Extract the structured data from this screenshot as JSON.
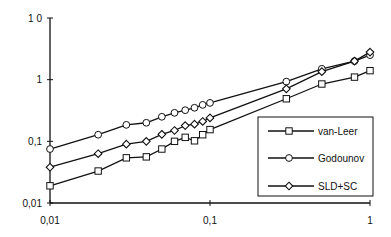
{
  "chart_data": {
    "type": "line",
    "title": "",
    "xlabel": "",
    "ylabel": "",
    "xscale": "log",
    "yscale": "log",
    "xlim": [
      0.01,
      1
    ],
    "ylim": [
      0.01,
      10
    ],
    "grid": false,
    "legend_position": "lower right (inside)",
    "x_ticks": [
      {
        "value": 0.01,
        "label": "0,01"
      },
      {
        "value": 0.1,
        "label": "0,1"
      },
      {
        "value": 1,
        "label": "1"
      }
    ],
    "y_ticks": [
      {
        "value": 0.01,
        "label": "0,01"
      },
      {
        "value": 0.1,
        "label": "0,1"
      },
      {
        "value": 1,
        "label": "1"
      },
      {
        "value": 10,
        "label": "1 0"
      }
    ],
    "series": [
      {
        "name": "van-Leer",
        "marker": "square",
        "x": [
          0.01,
          0.02,
          0.03,
          0.04,
          0.05,
          0.06,
          0.07,
          0.08,
          0.09,
          0.1,
          0.3,
          0.5,
          0.8,
          1.0
        ],
        "values": [
          0.019,
          0.033,
          0.054,
          0.056,
          0.075,
          0.1,
          0.116,
          0.102,
          0.128,
          0.155,
          0.49,
          0.85,
          1.1,
          1.4
        ]
      },
      {
        "name": "Godounov",
        "marker": "circle",
        "x": [
          0.01,
          0.02,
          0.03,
          0.04,
          0.05,
          0.06,
          0.07,
          0.08,
          0.09,
          0.1,
          0.3,
          0.5,
          0.8,
          1.0
        ],
        "values": [
          0.075,
          0.128,
          0.185,
          0.2,
          0.25,
          0.29,
          0.32,
          0.35,
          0.39,
          0.42,
          0.93,
          1.5,
          2.0,
          2.5
        ]
      },
      {
        "name": "SLD+SC",
        "marker": "diamond",
        "x": [
          0.01,
          0.02,
          0.03,
          0.04,
          0.05,
          0.06,
          0.07,
          0.08,
          0.09,
          0.1,
          0.3,
          0.5,
          0.8,
          1.0
        ],
        "values": [
          0.038,
          0.063,
          0.09,
          0.1,
          0.13,
          0.15,
          0.18,
          0.19,
          0.21,
          0.24,
          0.71,
          1.35,
          2.0,
          2.8
        ]
      }
    ]
  },
  "colors": {
    "line": "#111111",
    "background": "#ffffff"
  }
}
